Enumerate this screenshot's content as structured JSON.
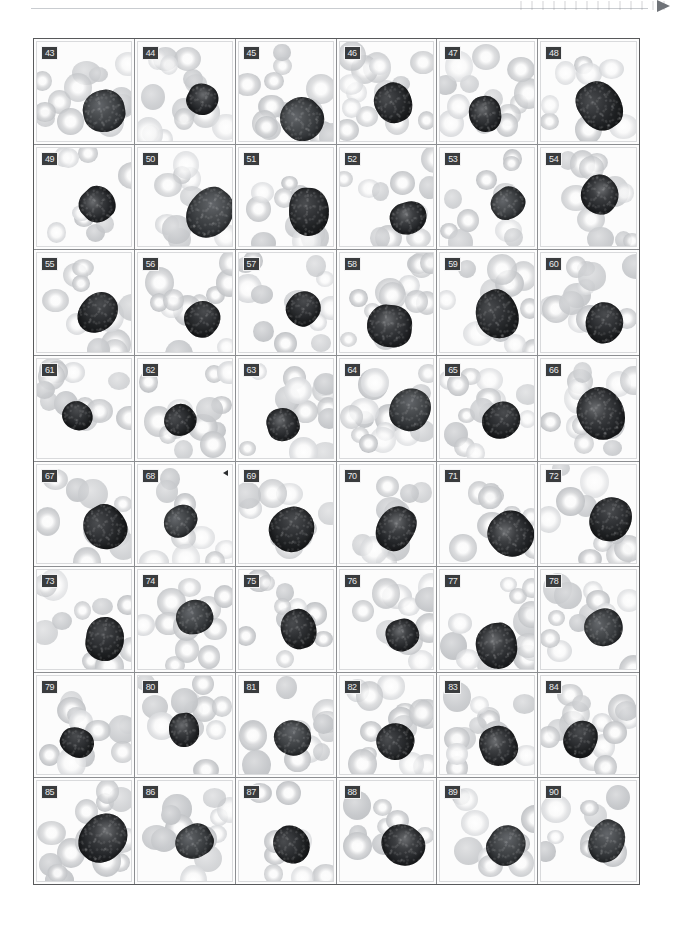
{
  "plate": {
    "title": "Blood cell micrograph plate",
    "rows": 8,
    "columns": 6,
    "first_number": 43,
    "last_number": 90,
    "panel_count": 48,
    "colors": {
      "page_background": "#ffffff",
      "plate_border": "#58595b",
      "cell_divider": "#8c8e91",
      "number_badge_background": "#3a3c3e",
      "number_badge_text": "#e9eaec",
      "erythrocyte_gray": "#c7c9cc",
      "leukocyte_dark": "#1e2022",
      "top_rule": "#c9ccd0"
    },
    "header": {
      "rule_present": true,
      "corner_marker": "arrow-marker"
    },
    "panels": [
      {
        "number": "43",
        "marker": false
      },
      {
        "number": "44",
        "marker": false
      },
      {
        "number": "45",
        "marker": false
      },
      {
        "number": "46",
        "marker": false
      },
      {
        "number": "47",
        "marker": false
      },
      {
        "number": "48",
        "marker": false
      },
      {
        "number": "49",
        "marker": false
      },
      {
        "number": "50",
        "marker": false
      },
      {
        "number": "51",
        "marker": false
      },
      {
        "number": "52",
        "marker": false
      },
      {
        "number": "53",
        "marker": false
      },
      {
        "number": "54",
        "marker": false
      },
      {
        "number": "55",
        "marker": false
      },
      {
        "number": "56",
        "marker": false
      },
      {
        "number": "57",
        "marker": false
      },
      {
        "number": "58",
        "marker": false
      },
      {
        "number": "59",
        "marker": false
      },
      {
        "number": "60",
        "marker": false
      },
      {
        "number": "61",
        "marker": false
      },
      {
        "number": "62",
        "marker": false
      },
      {
        "number": "63",
        "marker": false
      },
      {
        "number": "64",
        "marker": false
      },
      {
        "number": "65",
        "marker": false
      },
      {
        "number": "66",
        "marker": false
      },
      {
        "number": "67",
        "marker": false
      },
      {
        "number": "68",
        "marker": true
      },
      {
        "number": "69",
        "marker": false
      },
      {
        "number": "70",
        "marker": false
      },
      {
        "number": "71",
        "marker": false
      },
      {
        "number": "72",
        "marker": false
      },
      {
        "number": "73",
        "marker": false
      },
      {
        "number": "74",
        "marker": false
      },
      {
        "number": "75",
        "marker": false
      },
      {
        "number": "76",
        "marker": false
      },
      {
        "number": "77",
        "marker": false
      },
      {
        "number": "78",
        "marker": false
      },
      {
        "number": "79",
        "marker": false
      },
      {
        "number": "80",
        "marker": false
      },
      {
        "number": "81",
        "marker": false
      },
      {
        "number": "82",
        "marker": false
      },
      {
        "number": "83",
        "marker": false
      },
      {
        "number": "84",
        "marker": false
      },
      {
        "number": "85",
        "marker": false
      },
      {
        "number": "86",
        "marker": false
      },
      {
        "number": "87",
        "marker": false
      },
      {
        "number": "88",
        "marker": false
      },
      {
        "number": "89",
        "marker": false
      },
      {
        "number": "90",
        "marker": false
      }
    ]
  }
}
